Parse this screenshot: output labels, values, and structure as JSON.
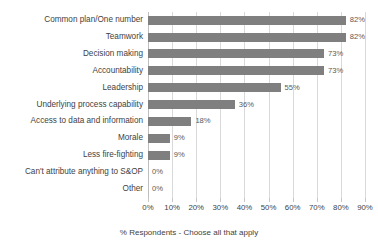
{
  "chart_data": {
    "type": "bar",
    "orientation": "horizontal",
    "title": "",
    "xlabel": "% Respondents - Choose all that apply",
    "ylabel": "",
    "xlim": [
      0,
      90
    ],
    "xtick_labels": [
      "0%",
      "10%",
      "20%",
      "30%",
      "40%",
      "50%",
      "60%",
      "70%",
      "80%",
      "90%"
    ],
    "xtick_values": [
      0,
      10,
      20,
      30,
      40,
      50,
      60,
      70,
      80,
      90
    ],
    "grid": true,
    "legend": false,
    "bar_color": "#7f7f7f",
    "gridline_color": "#d9d9d9",
    "categories": [
      "Common plan/One number",
      "Teamwork",
      "Decision making",
      "Accountability",
      "Leadership",
      "Underlying process capability",
      "Access to data and information",
      "Morale",
      "Less fire-fighting",
      "Can't attribute anything to S&OP",
      "Other"
    ],
    "values": [
      82,
      82,
      73,
      73,
      55,
      36,
      18,
      9,
      9,
      0,
      0
    ],
    "data_labels": [
      "82%",
      "82%",
      "73%",
      "73%",
      "55%",
      "36%",
      "18%",
      "9%",
      "9%",
      "0%",
      "0%"
    ]
  }
}
